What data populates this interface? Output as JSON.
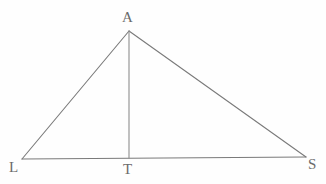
{
  "figure": {
    "kind": "geometry-diagram",
    "shape": "triangle-with-altitude",
    "background_color": "#fefefe",
    "stroke_color": "#7a7a7a",
    "label_color": "#6b6b6b",
    "stroke_width": 1.1,
    "canvas": {
      "width": 326,
      "height": 184
    },
    "points": {
      "A": {
        "x": 129,
        "y": 31,
        "label": "A",
        "label_x": 122,
        "label_y": 10
      },
      "L": {
        "x": 22,
        "y": 159,
        "label": "L",
        "label_x": 9,
        "label_y": 160
      },
      "T": {
        "x": 129,
        "y": 158,
        "label": "T",
        "label_x": 123,
        "label_y": 162
      },
      "S": {
        "x": 306,
        "y": 157,
        "label": "S",
        "label_x": 308,
        "label_y": 157
      }
    },
    "segments": [
      {
        "name": "side-LA",
        "from": "L",
        "to": "A",
        "x1": 22,
        "y1": 159,
        "x2": 129,
        "y2": 31
      },
      {
        "name": "side-AS",
        "from": "A",
        "to": "S",
        "x1": 129,
        "y1": 31,
        "x2": 306,
        "y2": 157
      },
      {
        "name": "base-LS",
        "from": "L",
        "to": "S",
        "x1": 22,
        "y1": 159,
        "x2": 306,
        "y2": 157
      },
      {
        "name": "altitude-AT",
        "from": "A",
        "to": "T",
        "x1": 129,
        "y1": 31,
        "x2": 129,
        "y2": 158
      }
    ],
    "labels": {
      "apex": "A",
      "base_left": "L",
      "base_foot": "T",
      "base_right": "S"
    }
  }
}
